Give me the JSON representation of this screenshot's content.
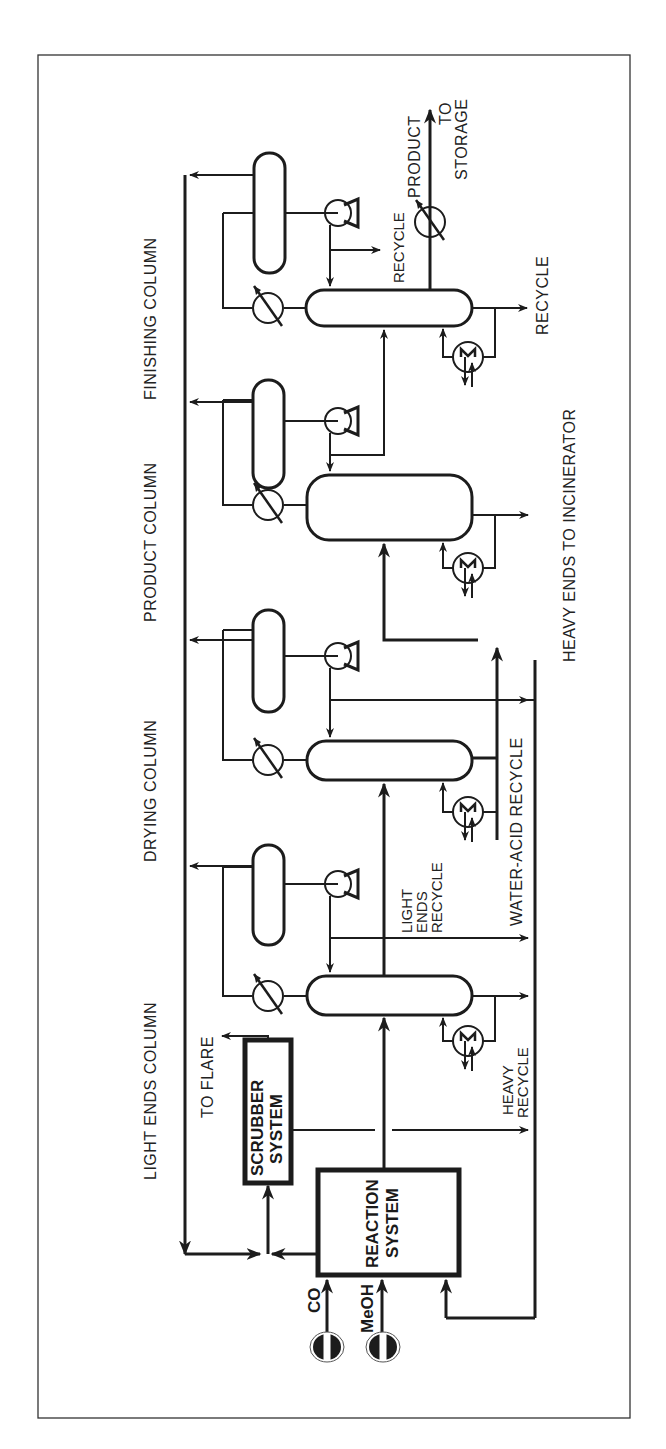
{
  "figure": {
    "orientation": "rotated-90-ccw",
    "line_color": "#1c1c1c",
    "background": "#ffffff"
  },
  "sections": {
    "light_ends": "LIGHT ENDS COLUMN",
    "drying": "DRYING COLUMN",
    "product": "PRODUCT COLUMN",
    "finishing": "FINISHING COLUMN"
  },
  "units": {
    "reaction_line1": "REACTION",
    "reaction_line2": "SYSTEM",
    "scrubber_line1": "SCRUBBER",
    "scrubber_line2": "SYSTEM"
  },
  "feeds": {
    "co": "CO",
    "meoh": "MeOH",
    "start_marker": "START"
  },
  "streams": {
    "to_flare": "TO FLARE",
    "heavy_recycle_1": "HEAVY",
    "heavy_recycle_2": "RECYCLE",
    "light_ends_recycle_1": "LIGHT",
    "light_ends_recycle_2": "ENDS",
    "light_ends_recycle_3": "RECYCLE",
    "water_acid_recycle": "WATER-ACID RECYCLE",
    "heavy_ends_incinerator": "HEAVY ENDS TO INCINERATOR",
    "finishing_bottoms_recycle": "RECYCLE",
    "finishing_overhead_recycle": "RECYCLE",
    "product": "PRODUCT",
    "to_storage_1": "TO",
    "to_storage_2": "STORAGE"
  }
}
